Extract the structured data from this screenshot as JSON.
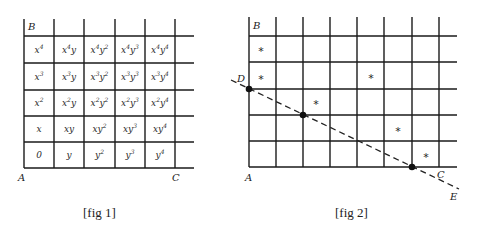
{
  "fig1": {
    "caption": "[fig 1]",
    "corner_labels": {
      "B": "B",
      "A": "A",
      "C": "C"
    },
    "columns_x": [
      24,
      54,
      84,
      115,
      145,
      175
    ],
    "rows_y": [
      36,
      63,
      90,
      116,
      142,
      168
    ],
    "line_extent": {
      "top": 19,
      "right": 194
    },
    "cells": [
      [
        {
          "b": "x",
          "e1": "4",
          "m": "",
          "e2": ""
        },
        {
          "b": "x",
          "e1": "4",
          "m": "y",
          "e2": ""
        },
        {
          "b": "x",
          "e1": "4",
          "m": "y",
          "e2": "2"
        },
        {
          "b": "x",
          "e1": "4",
          "m": "y",
          "e2": "3"
        },
        {
          "b": "x",
          "e1": "4",
          "m": "y",
          "e2": "4"
        }
      ],
      [
        {
          "b": "x",
          "e1": "3",
          "m": "",
          "e2": ""
        },
        {
          "b": "x",
          "e1": "3",
          "m": "y",
          "e2": ""
        },
        {
          "b": "x",
          "e1": "3",
          "m": "y",
          "e2": "2"
        },
        {
          "b": "x",
          "e1": "3",
          "m": "y",
          "e2": "3"
        },
        {
          "b": "x",
          "e1": "3",
          "m": "y",
          "e2": "4"
        }
      ],
      [
        {
          "b": "x",
          "e1": "2",
          "m": "",
          "e2": ""
        },
        {
          "b": "x",
          "e1": "2",
          "m": "y",
          "e2": ""
        },
        {
          "b": "x",
          "e1": "2",
          "m": "y",
          "e2": "2"
        },
        {
          "b": "x",
          "e1": "2",
          "m": "y",
          "e2": "3"
        },
        {
          "b": "x",
          "e1": "2",
          "m": "y",
          "e2": "4"
        }
      ],
      [
        {
          "b": "x",
          "e1": "",
          "m": "",
          "e2": ""
        },
        {
          "b": "xy",
          "e1": "",
          "m": "",
          "e2": ""
        },
        {
          "b": "xy",
          "e1": "2",
          "m": "",
          "e2": ""
        },
        {
          "b": "xy",
          "e1": "3",
          "m": "",
          "e2": ""
        },
        {
          "b": "xy",
          "e1": "4",
          "m": "",
          "e2": ""
        }
      ],
      [
        {
          "b": "0",
          "e1": "",
          "m": "",
          "e2": "",
          "upright": true
        },
        {
          "b": "y",
          "e1": "",
          "m": "",
          "e2": ""
        },
        {
          "b": "y",
          "e1": "2",
          "m": "",
          "e2": ""
        },
        {
          "b": "y",
          "e1": "3",
          "m": "",
          "e2": ""
        },
        {
          "b": "y",
          "e1": "4",
          "m": "",
          "e2": ""
        }
      ]
    ],
    "cells_text": [
      [
        "x^4",
        "x^4y",
        "x^4y^2",
        "x^4y^3",
        "x^4y^4"
      ],
      [
        "x^3",
        "x^3y",
        "x^3y^2",
        "x^3y^3",
        "x^3y^4"
      ],
      [
        "x^2",
        "x^2y",
        "x^2y^2",
        "x^2y^3",
        "x^2y^4"
      ],
      [
        "x",
        "xy",
        "xy^2",
        "xy^3",
        "xy^4"
      ],
      [
        "0",
        "y",
        "y^2",
        "y^3",
        "y^4"
      ]
    ]
  },
  "fig2": {
    "caption": "[fig 2]",
    "corner_labels": {
      "B": "B",
      "A": "A",
      "C": "C",
      "D": "D",
      "E": "E"
    },
    "columns_x": [
      249,
      276,
      303,
      330,
      357,
      384,
      412,
      439
    ],
    "rows_y": [
      36,
      62,
      89,
      115,
      141,
      167
    ],
    "line_extent": {
      "top": 17,
      "right": 457
    },
    "stars": [
      {
        "x": 261,
        "y": 50
      },
      {
        "x": 261,
        "y": 78
      },
      {
        "x": 316,
        "y": 103
      },
      {
        "x": 371,
        "y": 77
      },
      {
        "x": 398,
        "y": 130
      },
      {
        "x": 426,
        "y": 156
      }
    ],
    "star_glyph": "*",
    "dots": [
      {
        "name": "D",
        "x": 249,
        "y": 89
      },
      {
        "name": "mid",
        "x": 303,
        "y": 115
      },
      {
        "name": "bottom",
        "x": 412,
        "y": 167
      }
    ],
    "dashed_line": {
      "x1": 231,
      "y1": 80,
      "x2": 459,
      "y2": 189
    }
  }
}
